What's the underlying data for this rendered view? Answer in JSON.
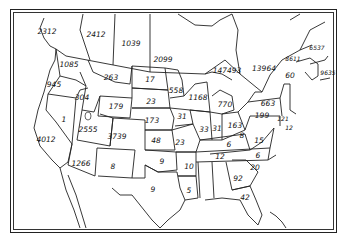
{
  "map": {
    "type": "choropleth-style numeric map",
    "region": "United States and southern Canada (state/province outlines)",
    "labels": [
      {
        "region": "British Columbia",
        "value": "2312",
        "x": 47,
        "y": 32
      },
      {
        "region": "Alberta",
        "value": "2412",
        "x": 96,
        "y": 35
      },
      {
        "region": "Saskatchewan",
        "value": "1039",
        "x": 131,
        "y": 44
      },
      {
        "region": "Manitoba",
        "value": "2099",
        "x": 163,
        "y": 60
      },
      {
        "region": "Ontario",
        "value": "147493",
        "x": 227,
        "y": 71
      },
      {
        "region": "Quebec",
        "value": "13964",
        "x": 264,
        "y": 69
      },
      {
        "region": "Quebec (Gaspe)",
        "value": "8611",
        "x": 293,
        "y": 59,
        "small": true
      },
      {
        "region": "Prince Edward Island",
        "value": "6537",
        "x": 317,
        "y": 48,
        "small": true
      },
      {
        "region": "Nova Scotia",
        "value": "9635",
        "x": 328,
        "y": 73,
        "small": true
      },
      {
        "region": "New Brunswick",
        "value": "60",
        "x": 290,
        "y": 76
      },
      {
        "region": "Washington",
        "value": "1085",
        "x": 69,
        "y": 65
      },
      {
        "region": "Oregon",
        "value": "945",
        "x": 54,
        "y": 85
      },
      {
        "region": "Idaho",
        "value": "304",
        "x": 82,
        "y": 98
      },
      {
        "region": "Montana",
        "value": "263",
        "x": 111,
        "y": 78
      },
      {
        "region": "North Dakota",
        "value": "17",
        "x": 150,
        "y": 80
      },
      {
        "region": "Minnesota",
        "value": "558",
        "x": 176,
        "y": 91
      },
      {
        "region": "Wisconsin",
        "value": "1168",
        "x": 198,
        "y": 98
      },
      {
        "region": "Michigan",
        "value": "770",
        "x": 225,
        "y": 105
      },
      {
        "region": "New York",
        "value": "663",
        "x": 268,
        "y": 104
      },
      {
        "region": "Vermont/New Hampshire",
        "value": "",
        "x": 285,
        "y": 100
      },
      {
        "region": "Massachusetts",
        "value": "121",
        "x": 283,
        "y": 119,
        "small": true
      },
      {
        "region": "Rhode Island/Connecticut",
        "value": "12",
        "x": 289,
        "y": 128,
        "small": true
      },
      {
        "region": "Wyoming",
        "value": "179",
        "x": 116,
        "y": 107
      },
      {
        "region": "South Dakota",
        "value": "23",
        "x": 151,
        "y": 102
      },
      {
        "region": "Iowa",
        "value": "31",
        "x": 182,
        "y": 117
      },
      {
        "region": "Nevada",
        "value": "1",
        "x": 64,
        "y": 120
      },
      {
        "region": "California",
        "value": "4012",
        "x": 46,
        "y": 140
      },
      {
        "region": "Utah",
        "value": "2555",
        "x": 88,
        "y": 130
      },
      {
        "region": "Colorado",
        "value": "3739",
        "x": 117,
        "y": 137
      },
      {
        "region": "Nebraska",
        "value": "173",
        "x": 152,
        "y": 121
      },
      {
        "region": "Kansas",
        "value": "48",
        "x": 156,
        "y": 141
      },
      {
        "region": "Missouri",
        "value": "23",
        "x": 180,
        "y": 143
      },
      {
        "region": "Illinois",
        "value": "33",
        "x": 204,
        "y": 130
      },
      {
        "region": "Indiana",
        "value": "31",
        "x": 217,
        "y": 129
      },
      {
        "region": "Ohio",
        "value": "163",
        "x": 235,
        "y": 126
      },
      {
        "region": "Pennsylvania",
        "value": "199",
        "x": 262,
        "y": 116
      },
      {
        "region": "West Virginia",
        "value": "8",
        "x": 242,
        "y": 136
      },
      {
        "region": "Virginia",
        "value": "15",
        "x": 259,
        "y": 141
      },
      {
        "region": "Kentucky",
        "value": "6",
        "x": 229,
        "y": 145
      },
      {
        "region": "Tennessee",
        "value": "12",
        "x": 220,
        "y": 157
      },
      {
        "region": "North Carolina",
        "value": "6",
        "x": 258,
        "y": 156
      },
      {
        "region": "Arizona",
        "value": "1266",
        "x": 81,
        "y": 164
      },
      {
        "region": "New Mexico",
        "value": "8",
        "x": 113,
        "y": 167
      },
      {
        "region": "Oklahoma",
        "value": "9",
        "x": 162,
        "y": 162
      },
      {
        "region": "Arkansas",
        "value": "10",
        "x": 189,
        "y": 167
      },
      {
        "region": "Texas",
        "value": "9",
        "x": 153,
        "y": 190
      },
      {
        "region": "Louisiana",
        "value": "5",
        "x": 189,
        "y": 191
      },
      {
        "region": "South Carolina",
        "value": "20",
        "x": 255,
        "y": 168
      },
      {
        "region": "Georgia",
        "value": "92",
        "x": 238,
        "y": 179
      },
      {
        "region": "Florida (north)",
        "value": "42",
        "x": 245,
        "y": 198
      }
    ]
  }
}
